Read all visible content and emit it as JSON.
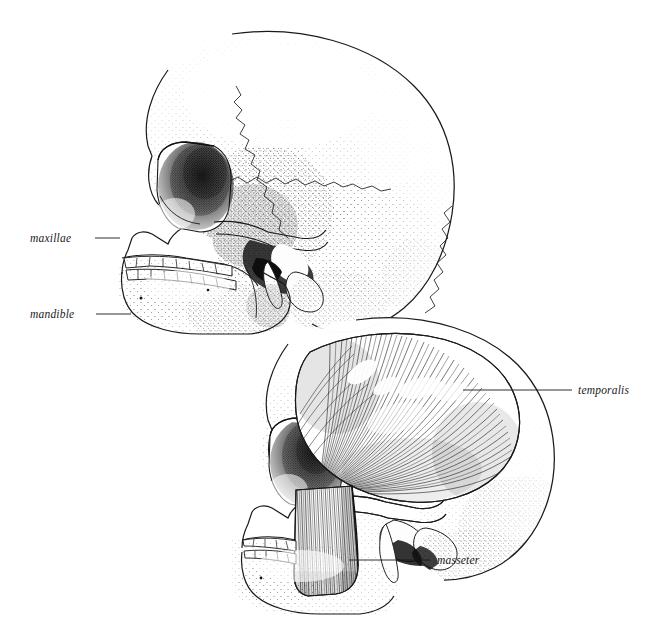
{
  "plate": {
    "title": "Lateral views of the human skull with muscles of mastication",
    "background_color": "#ffffff",
    "ink_color": "#1a1a1a",
    "style": "pen-and-ink stipple engraving",
    "width": 646,
    "height": 634
  },
  "figures": [
    {
      "id": "figure-upper-skull",
      "name": "bare skull lateral view",
      "position": "upper-left",
      "description": "Left lateral view of skull showing cranial sutures, orbit, zygomatic arch, maxillae, mandible and full dentition"
    },
    {
      "id": "figure-lower-skull",
      "name": "skull with muscles of mastication",
      "position": "lower-right",
      "description": "Left lateral view of skull with temporalis muscle filling the temporal fossa and masseter muscle descending to the mandibular angle"
    }
  ],
  "labels": [
    {
      "id": "label-maxillae",
      "text": "maxillae",
      "figure": "figure-upper-skull",
      "text_x": 30,
      "text_y": 242,
      "leader": {
        "x1": 95,
        "y1": 238,
        "x2": 120,
        "y2": 238
      }
    },
    {
      "id": "label-mandible",
      "text": "mandible",
      "figure": "figure-upper-skull",
      "text_x": 30,
      "text_y": 318,
      "leader": {
        "x1": 96,
        "y1": 314,
        "x2": 131,
        "y2": 314
      }
    },
    {
      "id": "label-temporalis",
      "text": "temporalis",
      "figure": "figure-lower-skull",
      "text_x": 578,
      "text_y": 394,
      "leader": {
        "x1": 463,
        "y1": 390,
        "x2": 572,
        "y2": 390
      }
    },
    {
      "id": "label-masseter",
      "text": "masseter",
      "figure": "figure-lower-skull",
      "text_x": 437,
      "text_y": 564,
      "leader": {
        "x1": 349,
        "y1": 560,
        "x2": 430,
        "y2": 560
      }
    }
  ],
  "anatomy": {
    "upper_skull_parts": [
      "frontal bone",
      "parietal bone",
      "occipital bone",
      "temporal bone",
      "coronal suture",
      "squamous suture",
      "lambdoid suture",
      "orbit",
      "nasal aperture",
      "zygomatic arch",
      "maxillae",
      "mandible",
      "upper teeth",
      "lower teeth",
      "mastoid process",
      "styloid process"
    ],
    "lower_skull_parts": [
      "cranium",
      "orbit",
      "zygomatic arch",
      "temporalis",
      "masseter",
      "mandible",
      "upper teeth",
      "lower teeth",
      "mastoid process",
      "condylar process"
    ],
    "teeth_per_row_visible": 8
  }
}
